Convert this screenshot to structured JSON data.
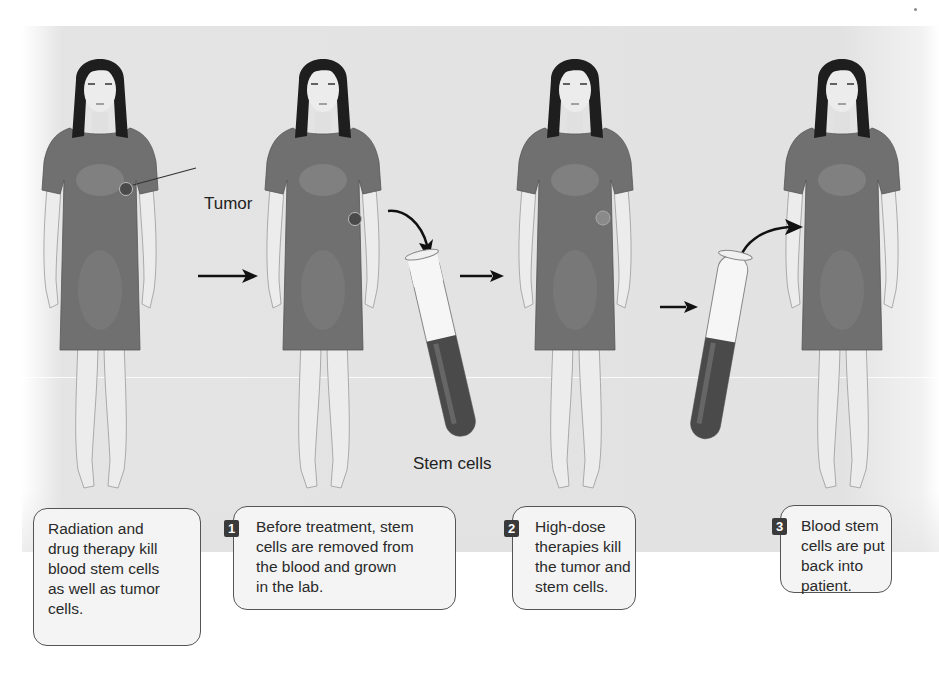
{
  "figure": {
    "labels": {
      "tumor": "Tumor",
      "stem_cells": "Stem cells"
    },
    "stages": [
      {
        "name": "untreated",
        "tumor_visible": true,
        "tumor_state": "dark"
      },
      {
        "name": "before-treatment",
        "tumor_visible": true,
        "tumor_state": "dark"
      },
      {
        "name": "high-dose",
        "tumor_visible": true,
        "tumor_state": "faded"
      },
      {
        "name": "after-reinfusion",
        "tumor_visible": false,
        "tumor_state": "none"
      }
    ],
    "icons": {
      "stage_arrow": "right-arrow-icon",
      "transfer_arrow": "curved-arrow-icon",
      "test_tube": "test-tube-icon"
    }
  },
  "captions": [
    {
      "number": "",
      "lines": [
        "Radiation and",
        "drug therapy kill",
        "blood stem cells",
        "as well as tumor",
        "cells."
      ]
    },
    {
      "number": "1",
      "lines": [
        "Before treatment, stem",
        "cells are removed from",
        "the blood and grown",
        "in the lab."
      ]
    },
    {
      "number": "2",
      "lines": [
        "High-dose",
        "therapies kill",
        "the tumor and",
        "stem cells."
      ]
    },
    {
      "number": "3",
      "lines": [
        "Blood stem",
        "cells are put",
        "back into",
        "patient."
      ]
    }
  ],
  "colors": {
    "background_panel": "#e2e2e2",
    "dress": "#6e6e6e",
    "skin": "#e8e8e8",
    "hair": "#1e1e1e",
    "tumor_dark": "#4a4a4a",
    "tumor_faded": "#8a8a8a",
    "caption_box": "#f4f4f4",
    "number_badge": "#3a3a3a",
    "blood": "#4a4a4a"
  }
}
